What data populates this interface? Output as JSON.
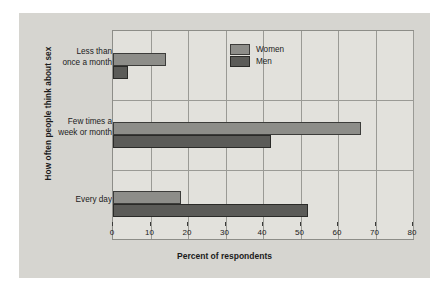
{
  "chart_data": {
    "type": "bar",
    "orientation": "horizontal",
    "title": "",
    "xlabel": "Percent of respondents",
    "ylabel": "How often people think about sex",
    "categories": [
      "Less than once a month",
      "Few times a week or month",
      "Every day"
    ],
    "category_lines": [
      [
        "Less than",
        "once a month"
      ],
      [
        "Few times a",
        "week or month"
      ],
      [
        "Every day"
      ]
    ],
    "series": [
      {
        "name": "Women",
        "values": [
          14,
          66,
          18
        ],
        "color": "#8d8d89"
      },
      {
        "name": "Men",
        "values": [
          4,
          42,
          52
        ],
        "color": "#5b5b58"
      }
    ],
    "xlim": [
      0,
      80
    ],
    "xticks": [
      0,
      10,
      20,
      30,
      40,
      50,
      60,
      70,
      80
    ],
    "xtick_labels": [
      "0",
      "10",
      "20",
      "30",
      "40",
      "50",
      "60",
      "70",
      "80"
    ],
    "grid": "vertical-and-horizontal",
    "legend_position": "top-right",
    "background_color": "#d6d5d0",
    "plot_background_color": "#e2e1dc"
  },
  "legend": {
    "items": [
      {
        "label": "Women"
      },
      {
        "label": "Men"
      }
    ]
  }
}
